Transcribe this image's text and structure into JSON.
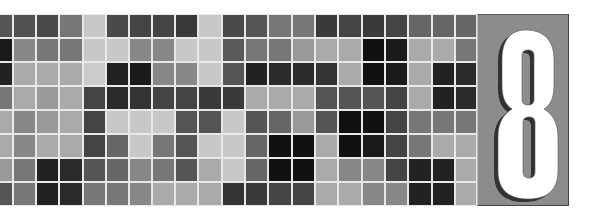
{
  "banner": {
    "chapter_number": "8",
    "panel_color": "#8c8c8c",
    "number_color": "#ffffff",
    "shadow_color": "#222222",
    "grid_line_color": "#e8e8e8"
  },
  "mosaic": {
    "rows": 8,
    "columns": 21,
    "column_edges": [
      0,
      13,
      36,
      59,
      83,
      106,
      129,
      152,
      175,
      198,
      222,
      245,
      268,
      292,
      315,
      338,
      362,
      385,
      408,
      432,
      455,
      477
    ],
    "row_height": 24,
    "cells": [
      [
        "#555555",
        "#505050",
        "#4a4a4a",
        "#777777",
        "#c8c8c8",
        "#4a4a4a",
        "#444444",
        "#444444",
        "#3a3a3a",
        "#c8c8c8",
        "#4a4a4a",
        "#555555",
        "#777777",
        "#777777",
        "#3a3a3a",
        "#444444",
        "#3a3a3a",
        "#444444",
        "#666666",
        "#666666",
        "#666666"
      ],
      [
        "#1a1a1a",
        "#888888",
        "#777777",
        "#777777",
        "#c8c8c8",
        "#c8c8c8",
        "#888888",
        "#888888",
        "#c8c8c8",
        "#c8c8c8",
        "#5a5a5a",
        "#777777",
        "#777777",
        "#999999",
        "#aaaaaa",
        "#aaaaaa",
        "#111111",
        "#1a1a1a",
        "#aaaaaa",
        "#aaaaaa",
        "#777777"
      ],
      [
        "#222222",
        "#aaaaaa",
        "#aaaaaa",
        "#aaaaaa",
        "#cccccc",
        "#222222",
        "#1a1a1a",
        "#888888",
        "#888888",
        "#c8c8c8",
        "#555555",
        "#222222",
        "#2a2a2a",
        "#2a2a2a",
        "#333333",
        "#aaaaaa",
        "#111111",
        "#1a1a1a",
        "#aaaaaa",
        "#222222",
        "#2a2a2a"
      ],
      [
        "#777777",
        "#aaaaaa",
        "#999999",
        "#aaaaaa",
        "#444444",
        "#2a2a2a",
        "#333333",
        "#444444",
        "#444444",
        "#3a3a3a",
        "#3a3a3a",
        "#aaaaaa",
        "#aaaaaa",
        "#aaaaaa",
        "#555555",
        "#555555",
        "#555555",
        "#444444",
        "#aaaaaa",
        "#222222",
        "#2a2a2a"
      ],
      [
        "#aaaaaa",
        "#888888",
        "#999999",
        "#aaaaaa",
        "#444444",
        "#c8c8c8",
        "#c8c8c8",
        "#c8c8c8",
        "#555555",
        "#555555",
        "#c8c8c8",
        "#555555",
        "#666666",
        "#999999",
        "#555555",
        "#111111",
        "#111111",
        "#444444",
        "#777777",
        "#777777",
        "#777777"
      ],
      [
        "#aaaaaa",
        "#888888",
        "#aaaaaa",
        "#aaaaaa",
        "#444444",
        "#666666",
        "#c8c8c8",
        "#777777",
        "#555555",
        "#c8c8c8",
        "#c8c8c8",
        "#666666",
        "#111111",
        "#111111",
        "#aaaaaa",
        "#111111",
        "#1a1a1a",
        "#444444",
        "#777777",
        "#aaaaaa",
        "#aaaaaa"
      ],
      [
        "#999999",
        "#777777",
        "#222222",
        "#2a2a2a",
        "#555555",
        "#666666",
        "#888888",
        "#777777",
        "#555555",
        "#aaaaaa",
        "#c8c8c8",
        "#666666",
        "#111111",
        "#111111",
        "#aaaaaa",
        "#888888",
        "#888888",
        "#444444",
        "#222222",
        "#222222",
        "#aaaaaa"
      ],
      [
        "#555555",
        "#777777",
        "#222222",
        "#2a2a2a",
        "#777777",
        "#777777",
        "#888888",
        "#aaaaaa",
        "#aaaaaa",
        "#aaaaaa",
        "#333333",
        "#3a3a3a",
        "#444444",
        "#444444",
        "#aaaaaa",
        "#aaaaaa",
        "#888888",
        "#888888",
        "#222222",
        "#222222",
        "#aaaaaa"
      ]
    ]
  }
}
